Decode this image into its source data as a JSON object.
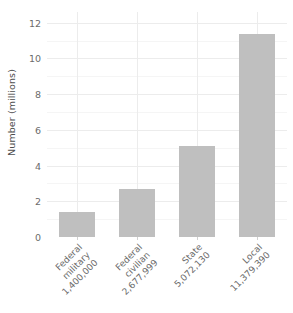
{
  "chart_data": {
    "type": "bar",
    "title": "",
    "subtitle": "",
    "xlabel": "",
    "ylabel": "Number (millions)",
    "categories": [
      "Federal\nmilitary\n1,400,000",
      "Federal\ncivilian\n2,677,999",
      "State\n5,072,130",
      "Local\n11,379,390"
    ],
    "category_lines": [
      [
        "Federal",
        "military",
        "1,400,000"
      ],
      [
        "Federal",
        "civilian",
        "2,677,999"
      ],
      [
        "State",
        "5,072,130"
      ],
      [
        "Local",
        "11,379,390"
      ]
    ],
    "values": [
      1.4,
      2.677999,
      5.07213,
      11.37939
    ],
    "raw_counts": [
      1400000,
      2677999,
      5072130,
      11379390
    ],
    "ylim": [
      0,
      12.6
    ],
    "yticks": [
      0,
      2,
      4,
      6,
      8,
      10,
      12
    ],
    "ytick_labels": [
      "0",
      "2",
      "4",
      "6",
      "8",
      "10",
      "12"
    ],
    "grid": true,
    "legend": "none",
    "bar_color": "#bfbfbf",
    "panel_background": "#ffffff",
    "gridline_color": "#ececec"
  }
}
